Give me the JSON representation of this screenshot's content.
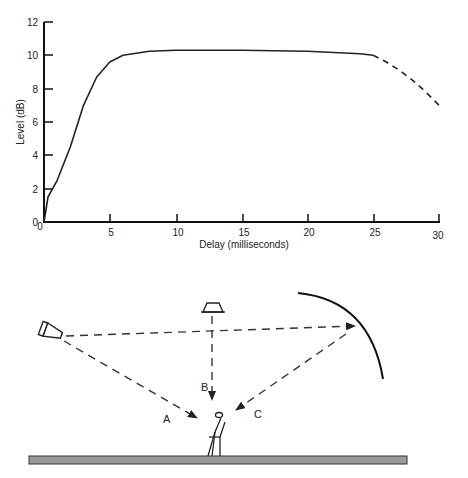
{
  "chart_data": {
    "type": "line",
    "title": "",
    "xlabel": "Delay  (milliseconds)",
    "ylabel": "Level  (dB)",
    "xlim": [
      0,
      30
    ],
    "ylim": [
      0,
      12
    ],
    "xticks": [
      "0",
      "5",
      "10",
      "15",
      "20",
      "25",
      "30"
    ],
    "yticks": [
      "0",
      "2",
      "4",
      "6",
      "8",
      "10",
      "12"
    ],
    "grid": false,
    "legend": null,
    "series": [
      {
        "name": "measured (solid)",
        "style": "solid",
        "x": [
          0,
          0.3,
          1,
          2,
          3,
          4,
          5,
          6,
          8,
          10,
          15,
          20,
          24,
          25
        ],
        "y": [
          0,
          1.5,
          2.5,
          4.5,
          7.0,
          8.7,
          9.6,
          10.0,
          10.25,
          10.3,
          10.3,
          10.25,
          10.1,
          10.0
        ]
      },
      {
        "name": "extrapolated (dashed)",
        "style": "dashed",
        "x": [
          25,
          26,
          27,
          28,
          29,
          30
        ],
        "y": [
          10.0,
          9.6,
          9.1,
          8.5,
          7.8,
          7.0
        ]
      }
    ]
  },
  "diagram": {
    "paths": [
      {
        "label": "A",
        "description": "direct sound from loudspeaker to listener"
      },
      {
        "label": "B",
        "description": "sound from overhead loudspeaker to listener"
      },
      {
        "label": "C",
        "description": "reflection from curved surface to listener"
      }
    ],
    "elements": [
      "side loudspeaker",
      "overhead loudspeaker",
      "curved reflector",
      "seated listener",
      "floor"
    ]
  }
}
